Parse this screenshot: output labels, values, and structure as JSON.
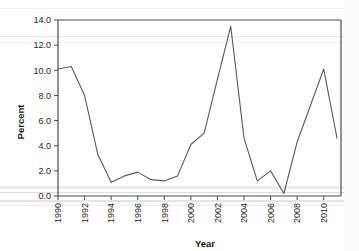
{
  "chart_data": {
    "type": "line",
    "title": "",
    "xlabel": "Year",
    "ylabel": "Percent",
    "xlim": [
      1990,
      2011.3
    ],
    "ylim": [
      0.0,
      14.0
    ],
    "grid": false,
    "legend": null,
    "legend_position": "none",
    "line_color": "#595959",
    "axis_color": "#4d4d4d",
    "background_color": "#ffffff",
    "x": [
      1990,
      1991,
      1992,
      1993,
      1994,
      1995,
      1996,
      1997,
      1998,
      1999,
      2000,
      2001,
      2002,
      2003,
      2004,
      2005,
      2006,
      2007,
      2008,
      2009,
      2010,
      2011
    ],
    "values": [
      10.1,
      10.3,
      8.0,
      3.3,
      1.1,
      1.6,
      1.9,
      1.3,
      1.2,
      1.6,
      4.1,
      5.0,
      9.3,
      13.5,
      4.6,
      1.2,
      2.0,
      0.2,
      4.3,
      7.2,
      10.1,
      4.6
    ],
    "series": [
      {
        "name": "Percent",
        "values": [
          10.1,
          10.3,
          8.0,
          3.3,
          1.1,
          1.6,
          1.9,
          1.3,
          1.2,
          1.6,
          4.1,
          5.0,
          9.3,
          13.5,
          4.6,
          1.2,
          2.0,
          0.2,
          4.3,
          7.2,
          10.1,
          4.6
        ]
      }
    ],
    "ytick_labels": [
      "0.0",
      "2.0",
      "4.0",
      "6.0",
      "8.0",
      "10.0",
      "12.0",
      "14.0"
    ],
    "ytick_values": [
      0.0,
      2.0,
      4.0,
      6.0,
      8.0,
      10.0,
      12.0,
      14.0
    ],
    "xtick_labels": [
      "1990",
      "1992",
      "1994",
      "1996",
      "1998",
      "2000",
      "2002",
      "2004",
      "2006",
      "2008",
      "2010"
    ],
    "xtick_values": [
      1990,
      1992,
      1994,
      1996,
      1998,
      2000,
      2002,
      2004,
      2006,
      2008,
      2010
    ]
  }
}
